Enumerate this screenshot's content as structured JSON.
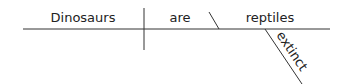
{
  "diagram": {
    "type": "sentence-diagram",
    "sentence": "Dinosaurs are extinct reptiles",
    "words": {
      "subject": "Dinosaurs",
      "verb": "are",
      "predicate_nominative": "reptiles",
      "modifier": "extinct"
    },
    "colors": {
      "line": "#333333",
      "text": "#222222",
      "background": "#ffffff"
    }
  }
}
